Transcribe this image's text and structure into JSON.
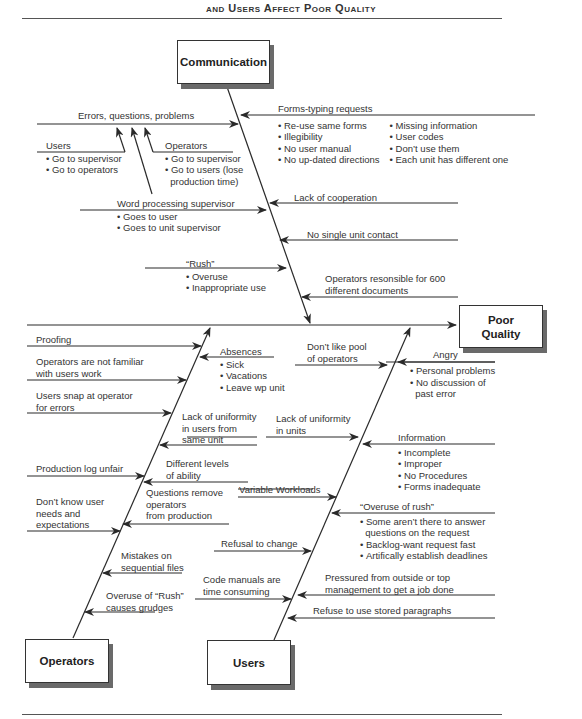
{
  "page": {
    "title": "and Users Affect Poor Quality"
  },
  "effect": {
    "label": "Poor Quality"
  },
  "categories": {
    "communication": {
      "label": "Communication",
      "causes": [
        {
          "label": "Errors, questions, problems",
          "sub": [
            {
              "label": "Users",
              "items": [
                "Go to supervisor",
                "Go to operators"
              ]
            },
            {
              "label": "Operators",
              "items": [
                "Go to supervisor",
                "Go to users (lose",
                "production time)"
              ]
            }
          ]
        },
        {
          "label": "Forms-typing requests",
          "items_col1": [
            "Re-use same forms",
            "Illegibility",
            "No user manual",
            "No up-dated directions"
          ],
          "items_col2": [
            "Missing information",
            "User codes",
            "Don’t use them",
            "Each unit has different one"
          ]
        },
        {
          "label": "Word processing supervisor",
          "items": [
            "Goes to user",
            "Goes to unit supervisor"
          ]
        },
        {
          "label": "Lack of cooperation"
        },
        {
          "label": "No single unit contact"
        },
        {
          "label": "“Rush”",
          "items": [
            "Overuse",
            "Inappropriate use"
          ]
        },
        {
          "label_line1": "Operators resonsible for 600",
          "label_line2": "different documents"
        }
      ]
    },
    "operators": {
      "label": "Operators",
      "causes": [
        {
          "label": "Proofing"
        },
        {
          "label_line1": "Operators are not familiar",
          "label_line2": "with users work"
        },
        {
          "label_line1": "Users snap at operator",
          "label_line2": "for errors"
        },
        {
          "label": "Absences",
          "items": [
            "Sick",
            "Vacations",
            "Leave wp unit"
          ]
        },
        {
          "label_line1": "Lack of uniformity",
          "label_line2": "in users from",
          "label_line3": "same unit"
        },
        {
          "label": "Production log unfair"
        },
        {
          "label_line1": "Different levels",
          "label_line2": "of ability"
        },
        {
          "label_line1": "Don’t know user",
          "label_line2": "needs and",
          "label_line3": "expectations"
        },
        {
          "label_line1": "Questions remove",
          "label_line2": "operators",
          "label_line3": "from production"
        },
        {
          "label_line1": "Mistakes on",
          "label_line2": "sequential files"
        },
        {
          "label_line1": "Overuse of “Rush”",
          "label_line2": "causes grudges"
        }
      ]
    },
    "users": {
      "label": "Users",
      "causes": [
        {
          "label_line1": "Don’t like pool",
          "label_line2": "of operators"
        },
        {
          "label": "Angry",
          "items": [
            "Personal problems",
            "No discussion of",
            "past error"
          ]
        },
        {
          "label_line1": "Lack of uniformity",
          "label_line2": "in units"
        },
        {
          "label": "Information",
          "items": [
            "Incomplete",
            "Improper",
            "No Procedures",
            "Forms inadequate"
          ]
        },
        {
          "label": "Variable Workloads"
        },
        {
          "label": "“Overuse of rush”",
          "items": [
            "Some aren’t there to answer",
            "questions on the request",
            "Backlog-want request fast",
            "Artifically establish deadlines"
          ]
        },
        {
          "label": "Refusal to change"
        },
        {
          "label_line1": "Code manuals are",
          "label_line2": "time consuming"
        },
        {
          "label_line1": "Pressured from outside or top",
          "label_line2": "management to get a job done"
        },
        {
          "label": "Refuse to use stored paragraphs"
        }
      ]
    }
  },
  "colors": {
    "line": "#2a2a2a",
    "shadow": "#6a6a6a",
    "text": "#333333"
  }
}
